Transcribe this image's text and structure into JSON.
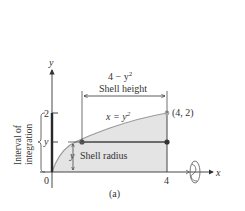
{
  "figure": {
    "caption": "(a)",
    "colors": {
      "region_fill": "#e4e4e4",
      "curve": "#9a9a9a",
      "axis": "#333333",
      "points": "#444444",
      "point_endpoint": "#a8a8a8"
    },
    "axes": {
      "x_label": "x",
      "y_label": "y",
      "origin_label": "0",
      "x_tick_4": "4",
      "y_tick_2": "2",
      "y_tick_y": "y"
    },
    "curve_label_lhs": "x = y",
    "curve_label_exp": "2",
    "point_label": "(4, 2)",
    "shell_height_expr_base": "4 − y",
    "shell_height_expr_exp": "2",
    "shell_height_label": "Shell height",
    "shell_radius_var": "y",
    "shell_radius_label": "Shell radius",
    "interval_label_line1": "Interval of",
    "interval_label_line2": "integration",
    "rotation_icon": "rotation-about-x-axis-icon"
  }
}
